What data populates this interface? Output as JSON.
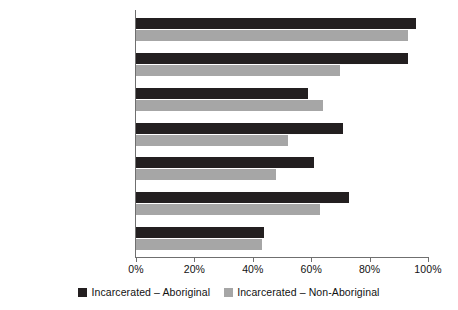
{
  "chart_data": {
    "type": "bar",
    "orientation": "horizontal",
    "title": "",
    "xlabel": "",
    "ylabel": "",
    "xlim": [
      0,
      100
    ],
    "xticks": [
      "0%",
      "20%",
      "40%",
      "60%",
      "80%",
      "100%"
    ],
    "xtick_values": [
      0,
      20,
      40,
      60,
      80,
      100
    ],
    "grid": false,
    "legend_position": "bottom",
    "categories": [
      "Personal/emotional",
      "Substance abuse",
      "Attitude",
      "Employment",
      "Marital/family",
      "Social interaction",
      "Community functioning"
    ],
    "series": [
      {
        "name": "Incarcerated – Aboriginal",
        "color": "#231f20",
        "values": [
          96,
          93,
          59,
          71,
          61,
          73,
          44
        ]
      },
      {
        "name": "Incarcerated – Non-Aboriginal",
        "color": "#a6a6a6",
        "values": [
          93,
          70,
          64,
          52,
          48,
          63,
          43
        ]
      }
    ]
  },
  "legend": {
    "entries": [
      {
        "label": "Incarcerated – Aboriginal",
        "swatch": "dark"
      },
      {
        "label": "Incarcerated – Non-Aboriginal",
        "swatch": "light"
      }
    ]
  }
}
